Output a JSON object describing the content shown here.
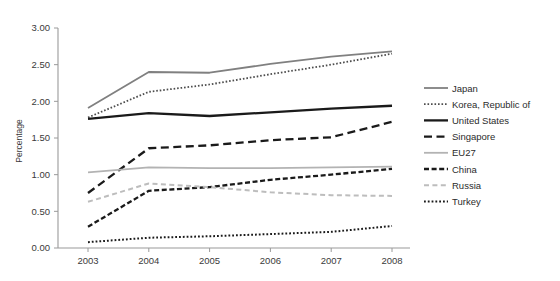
{
  "chart_data": {
    "type": "line",
    "title": "",
    "xlabel": "",
    "ylabel": "Percentage",
    "categories": [
      "2003",
      "2004",
      "2005",
      "2006",
      "2007",
      "2008"
    ],
    "x": [
      2003,
      2004,
      2005,
      2006,
      2007,
      2008
    ],
    "ylim": [
      0.0,
      3.0
    ],
    "ytick_step": 0.5,
    "ytick_labels": [
      "0.00",
      "0.50",
      "1.00",
      "1.50",
      "2.00",
      "2.50",
      "3.00"
    ],
    "ytick_values": [
      0.0,
      0.5,
      1.0,
      1.5,
      2.0,
      2.5,
      3.0
    ],
    "grid": false,
    "legend_position": "right",
    "series": [
      {
        "name": "Japan",
        "values": [
          1.91,
          2.4,
          2.39,
          2.51,
          2.61,
          2.68
        ],
        "color": "#808080",
        "style": "solid",
        "width": 1.8,
        "dash": ""
      },
      {
        "name": "Korea, Republic of",
        "values": [
          1.78,
          2.13,
          2.23,
          2.37,
          2.5,
          2.65
        ],
        "color": "#4d4d4d",
        "style": "dotted",
        "width": 1.8,
        "dash": "1.6,1.9"
      },
      {
        "name": "United States",
        "values": [
          1.76,
          1.84,
          1.8,
          1.85,
          1.9,
          1.94
        ],
        "color": "#1a1a1a",
        "style": "solid",
        "width": 2.3,
        "dash": ""
      },
      {
        "name": "Singapore",
        "values": [
          0.75,
          1.36,
          1.4,
          1.47,
          1.51,
          1.72
        ],
        "color": "#1a1a1a",
        "style": "dashed-long",
        "width": 2.3,
        "dash": "8,4.5"
      },
      {
        "name": "EU27",
        "values": [
          1.03,
          1.1,
          1.09,
          1.09,
          1.1,
          1.11
        ],
        "color": "#b3b3b3",
        "style": "solid",
        "width": 1.8,
        "dash": ""
      },
      {
        "name": "China",
        "values": [
          0.29,
          0.78,
          0.83,
          0.93,
          1.0,
          1.08
        ],
        "color": "#1a1a1a",
        "style": "dashed-short",
        "width": 2.3,
        "dash": "5,2.6"
      },
      {
        "name": "Russia",
        "values": [
          0.63,
          0.88,
          0.83,
          0.76,
          0.72,
          0.71
        ],
        "color": "#bdbdbd",
        "style": "dashed-short",
        "width": 2.0,
        "dash": "5,3.4"
      },
      {
        "name": "Turkey",
        "values": [
          0.08,
          0.14,
          0.16,
          0.19,
          0.22,
          0.3
        ],
        "color": "#1a1a1a",
        "style": "dotted",
        "width": 2.0,
        "dash": "1.8,2.0"
      }
    ]
  },
  "axes": {
    "y_title": "Percentage",
    "axis_color": "#9a9a9a",
    "tick_color": "#9a9a9a"
  }
}
